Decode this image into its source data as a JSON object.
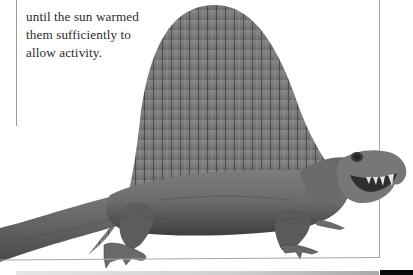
{
  "page": {
    "type": "book-page-scan",
    "colors": {
      "background": "#ffffff",
      "text": "#2b2b2b",
      "frame_line": "#a0a0a0",
      "illustration_tone": "#6e6e6e",
      "bottom_bar_dark": "#0a0a0a"
    }
  },
  "caption": {
    "lines": [
      "when they laid eggs",
      "until the sun warmed",
      "them sufficiently to",
      "allow activity."
    ]
  },
  "illustration": {
    "subject": "sail-backed reptile (Dimetrodon) illustration",
    "style": "grayscale pencil drawing"
  }
}
